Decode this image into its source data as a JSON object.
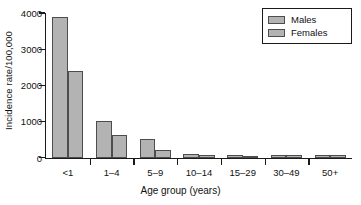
{
  "chart_data": {
    "type": "bar",
    "title": "",
    "subtitle": "",
    "xlabel": "Age group (years)",
    "ylabel": "Incidence rate/100,000",
    "categories": [
      "<1",
      "1–4",
      "5–9",
      "10–14",
      "15–29",
      "30–49",
      "50+"
    ],
    "series": [
      {
        "name": "Males",
        "values": [
          3900,
          1000,
          520,
          95,
          60,
          70,
          80
        ]
      },
      {
        "name": "Females",
        "values": [
          2400,
          620,
          200,
          70,
          55,
          65,
          70
        ]
      }
    ],
    "ylim": [
      0,
      4000
    ],
    "yticks": [
      0,
      1000,
      2000,
      3000,
      4000
    ],
    "ytick_labels": [
      "0",
      "1000",
      "2000",
      "3000",
      "4000"
    ],
    "grid": false,
    "legend_position": "top-right",
    "colors": {
      "bar_fill": "#b3b3b3",
      "bar_edge": "#4d4d4d",
      "axis": "#1a1a1a",
      "text": "#111111",
      "background": "#ffffff"
    }
  },
  "legend": {
    "entries": [
      {
        "label": "Males"
      },
      {
        "label": "Females"
      }
    ]
  }
}
